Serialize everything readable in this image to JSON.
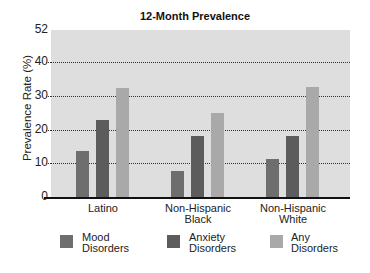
{
  "chart_data": {
    "type": "bar",
    "title": "12-Month Prevalence",
    "xlabel": "",
    "ylabel": "Prevalence Rate (%)",
    "ylim": [
      0,
      52
    ],
    "yticks": [
      0,
      10,
      20,
      30,
      40,
      52
    ],
    "gridlines": [
      10,
      20,
      30,
      40
    ],
    "grid": true,
    "legend_position": "bottom",
    "categories": [
      "Latino",
      "Non-Hispanic Black",
      "Non-Hispanic White"
    ],
    "category_lines": [
      [
        "Latino"
      ],
      [
        "Non-Hispanic",
        "Black"
      ],
      [
        "Non-Hispanic",
        "White"
      ]
    ],
    "series": [
      {
        "name": "Mood Disorders",
        "label_lines": [
          "Mood",
          "Disorders"
        ],
        "color": "#6e6e6e",
        "values": [
          13.7,
          7.7,
          11.2
        ]
      },
      {
        "name": "Anxiety Disorders",
        "label_lines": [
          "Anxiety",
          "Disorders"
        ],
        "color": "#5c5c5c",
        "values": [
          22.8,
          18.1,
          18.0
        ]
      },
      {
        "name": "Any Disorders",
        "label_lines": [
          "Any",
          "Disorders"
        ],
        "color": "#a9a9a9",
        "values": [
          32.3,
          24.8,
          32.8
        ]
      }
    ]
  },
  "colors": {
    "plot_background": "#dedede",
    "axis": "#111111",
    "grid": "#333333"
  }
}
